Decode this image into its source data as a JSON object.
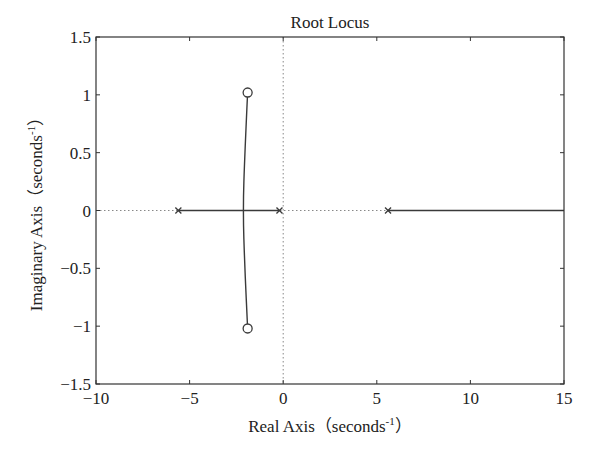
{
  "chart_data": {
    "type": "scatter",
    "title": "Root Locus",
    "xlabel": "Real Axis（seconds⁻¹）",
    "ylabel": "Imaginary Axis（seconds⁻¹）",
    "xlabel_parts": {
      "main": "Real Axis（seconds",
      "sup": "-1",
      "end": "）"
    },
    "ylabel_parts": {
      "main": "Imaginary Axis（seconds",
      "sup": "-1",
      "end": "）"
    },
    "xlim": [
      -10,
      15
    ],
    "ylim": [
      -1.5,
      1.5
    ],
    "xticks": [
      -10,
      -5,
      0,
      5,
      10,
      15
    ],
    "xtick_labels": [
      "−10",
      "−5",
      "0",
      "5",
      "10",
      "15"
    ],
    "yticks": [
      -1.5,
      -1,
      -0.5,
      0,
      0.5,
      1,
      1.5
    ],
    "ytick_labels": [
      "−1.5",
      "−1",
      "−0.5",
      "0",
      "0.5",
      "1",
      "1.5"
    ],
    "grid": false,
    "reference_lines": {
      "x0_dotted": true,
      "y0_dotted": true
    },
    "poles": [
      {
        "re": -5.6,
        "im": 0
      },
      {
        "re": -0.2,
        "im": 0
      },
      {
        "re": 5.6,
        "im": 0
      }
    ],
    "zeros": [
      {
        "re": -1.9,
        "im": 1.02
      },
      {
        "re": -1.9,
        "im": -1.02
      }
    ],
    "branches": [
      {
        "name": "real-axis-segment-left",
        "points": [
          [
            -5.6,
            0
          ],
          [
            -0.2,
            0
          ]
        ]
      },
      {
        "name": "complex-branch",
        "points": [
          [
            -1.9,
            1.02
          ],
          [
            -2.05,
            0.5
          ],
          [
            -2.15,
            0
          ],
          [
            -2.05,
            -0.5
          ],
          [
            -1.9,
            -1.02
          ]
        ]
      },
      {
        "name": "real-axis-segment-right",
        "points": [
          [
            5.6,
            0
          ],
          [
            15,
            0
          ]
        ]
      }
    ]
  }
}
